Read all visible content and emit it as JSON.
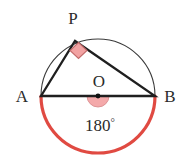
{
  "figure": {
    "kind": "circle-geometry-diagram",
    "canvas": {
      "width": 190,
      "height": 164,
      "background": "#ffffff"
    },
    "circle": {
      "center": {
        "x": 98,
        "y": 96
      },
      "radius": 57,
      "upper_arc": {
        "color": "#3a3a3a",
        "width": 1.1
      },
      "lower_arc": {
        "color": "#e04a42",
        "width": 3.2,
        "label": "highlighted-semicircle"
      }
    },
    "points": {
      "A": {
        "x": 41,
        "y": 96
      },
      "B": {
        "x": 155,
        "y": 96
      },
      "P": {
        "x": 75,
        "y": 41
      },
      "O": {
        "x": 98,
        "y": 96
      }
    },
    "labels": {
      "p": "P",
      "a": "A",
      "o": "O",
      "b": "B",
      "angle_value": "180",
      "degree": "°"
    },
    "label_positions": {
      "p": {
        "x": 73,
        "y": 24
      },
      "a": {
        "x": 22,
        "y": 102
      },
      "o": {
        "x": 99,
        "y": 87
      },
      "b": {
        "x": 170,
        "y": 102
      },
      "angle_value": {
        "x": 100,
        "y": 130
      }
    },
    "triangle": {
      "name": "triangle-APB",
      "stroke": "#1f1f1f",
      "width": 2.3,
      "vertices": [
        "A",
        "P",
        "B"
      ]
    },
    "markers": {
      "right_angle": {
        "name": "right-angle-marker-at-P",
        "shape": "diamond",
        "fill": "#f2a3a3",
        "stroke": "#c26a6a",
        "size": 13,
        "center": {
          "x": 78,
          "y": 50
        }
      },
      "straight_angle": {
        "name": "straight-angle-marker-at-O",
        "shape": "semicircle",
        "fill": "#f4a9aa",
        "stroke": "#d98d8f",
        "radius": 11,
        "center": {
          "x": 98,
          "y": 96
        },
        "orientation": "below"
      },
      "center_dot": {
        "name": "center-point-dot",
        "fill": "#111111",
        "radius": 2.4,
        "center": {
          "x": 98,
          "y": 96
        }
      }
    },
    "colors": {
      "highlight_red": "#e04a42",
      "marker_pink": "#f2a3a3",
      "line_dark": "#1f1f1f",
      "arc_gray": "#3a3a3a",
      "text": "#2b2b2b"
    }
  }
}
